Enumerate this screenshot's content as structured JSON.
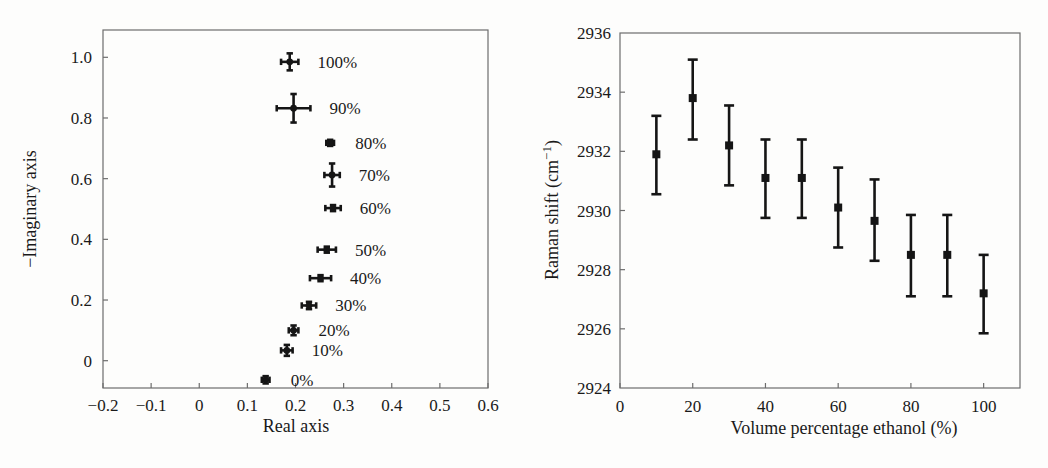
{
  "figure": {
    "panels": [
      "impedance-nyquist-plot",
      "raman-shift-plot"
    ]
  },
  "chart_data": [
    {
      "type": "scatter",
      "title": "",
      "xlabel": "Real axis",
      "ylabel": "−Imaginary axis",
      "xlim": [
        -0.2,
        0.6
      ],
      "ylim": [
        -0.09,
        1.09
      ],
      "xticks": [
        "−0.2",
        "−0.1",
        "0",
        "0.1",
        "0.2",
        "0.3",
        "0.4",
        "0.5",
        "0.6"
      ],
      "xtick_values": [
        -0.2,
        -0.1,
        0,
        0.1,
        0.2,
        0.3,
        0.4,
        0.5,
        0.6
      ],
      "yticks": [
        "0",
        "0.2",
        "0.4",
        "0.6",
        "0.8",
        "1.0"
      ],
      "ytick_values": [
        0,
        0.2,
        0.4,
        0.6,
        0.8,
        1.0
      ],
      "grid": false,
      "legend": "none",
      "annotations_position": "right-of-point",
      "points": [
        {
          "label": "100%",
          "x": 0.188,
          "y": 0.985,
          "xerr": 0.018,
          "yerr": 0.028
        },
        {
          "label": "90%",
          "x": 0.196,
          "y": 0.832,
          "xerr": 0.035,
          "yerr": 0.047
        },
        {
          "label": "80%",
          "x": 0.272,
          "y": 0.718,
          "xerr": 0.008,
          "yerr": 0.01
        },
        {
          "label": "70%",
          "x": 0.276,
          "y": 0.612,
          "xerr": 0.016,
          "yerr": 0.038
        },
        {
          "label": "60%",
          "x": 0.278,
          "y": 0.503,
          "xerr": 0.016,
          "yerr": 0.008
        },
        {
          "label": "50%",
          "x": 0.265,
          "y": 0.366,
          "xerr": 0.019,
          "yerr": 0.008
        },
        {
          "label": "40%",
          "x": 0.252,
          "y": 0.272,
          "xerr": 0.022,
          "yerr": 0.008
        },
        {
          "label": "30%",
          "x": 0.228,
          "y": 0.182,
          "xerr": 0.015,
          "yerr": 0.012
        },
        {
          "label": "20%",
          "x": 0.196,
          "y": 0.1,
          "xerr": 0.01,
          "yerr": 0.016
        },
        {
          "label": "10%",
          "x": 0.182,
          "y": 0.034,
          "xerr": 0.012,
          "yerr": 0.018
        },
        {
          "label": "0%",
          "x": 0.138,
          "y": -0.063,
          "xerr": 0.008,
          "yerr": 0.012
        }
      ]
    },
    {
      "type": "scatter",
      "title": "",
      "xlabel": "Volume percentage ethanol (%)",
      "ylabel": "Raman shift (cm⁻¹)",
      "xlim": [
        0,
        110
      ],
      "ylim": [
        2924,
        2936
      ],
      "xticks": [
        "0",
        "20",
        "40",
        "60",
        "80",
        "100"
      ],
      "xtick_values": [
        0,
        20,
        40,
        60,
        80,
        100
      ],
      "yticks": [
        "2924",
        "2926",
        "2928",
        "2930",
        "2932",
        "2934",
        "2936"
      ],
      "ytick_values": [
        2924,
        2926,
        2928,
        2930,
        2932,
        2934,
        2936
      ],
      "grid": false,
      "legend": "none",
      "points": [
        {
          "x": 10,
          "y": 2931.9,
          "yerr_low": 2930.55,
          "yerr_high": 2933.2
        },
        {
          "x": 20,
          "y": 2933.8,
          "yerr_low": 2932.4,
          "yerr_high": 2935.1
        },
        {
          "x": 30,
          "y": 2932.2,
          "yerr_low": 2930.85,
          "yerr_high": 2933.55
        },
        {
          "x": 40,
          "y": 2931.1,
          "yerr_low": 2929.75,
          "yerr_high": 2932.4
        },
        {
          "x": 50,
          "y": 2931.1,
          "yerr_low": 2929.75,
          "yerr_high": 2932.4
        },
        {
          "x": 60,
          "y": 2930.1,
          "yerr_low": 2928.75,
          "yerr_high": 2931.45
        },
        {
          "x": 70,
          "y": 2929.65,
          "yerr_low": 2928.3,
          "yerr_high": 2931.05
        },
        {
          "x": 80,
          "y": 2928.5,
          "yerr_low": 2927.1,
          "yerr_high": 2929.85
        },
        {
          "x": 90,
          "y": 2928.5,
          "yerr_low": 2927.1,
          "yerr_high": 2929.85
        },
        {
          "x": 100,
          "y": 2927.2,
          "yerr_low": 2925.85,
          "yerr_high": 2928.5
        }
      ]
    }
  ]
}
